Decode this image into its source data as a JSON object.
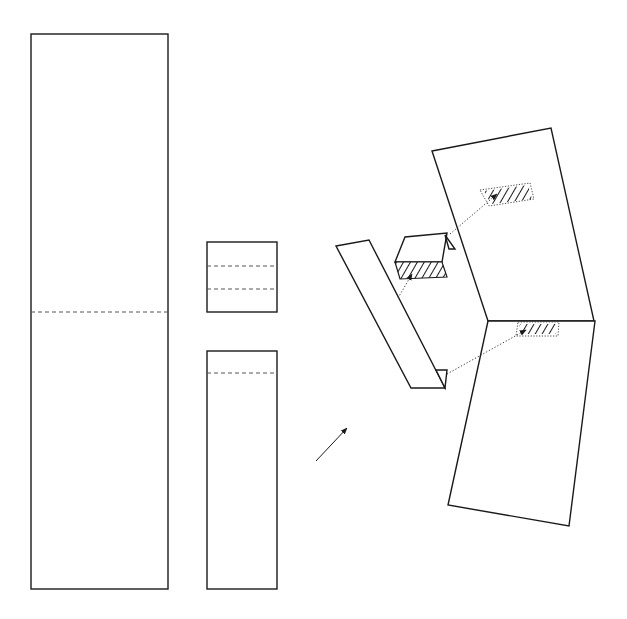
{
  "figure": {
    "colors": {
      "line": "#1a1a1a",
      "background": "#ffffff",
      "fold_line": "#555555"
    }
  },
  "pieces": {
    "tall_sheet": {
      "fold_lines": 1,
      "label": ""
    },
    "square_piece": {
      "fold_lines": 2,
      "label": ""
    },
    "narrow_strip": {
      "fold_lines": 1,
      "label": ""
    }
  },
  "assembly": {
    "direction_arrow": "arrow-up-right",
    "folded_strip": {
      "end_flap": true
    },
    "folded_tab": {
      "hatched_face": true
    },
    "panel": {
      "upper_target_hatched": true,
      "lower_target_hatched": true
    },
    "connectors": 3
  }
}
